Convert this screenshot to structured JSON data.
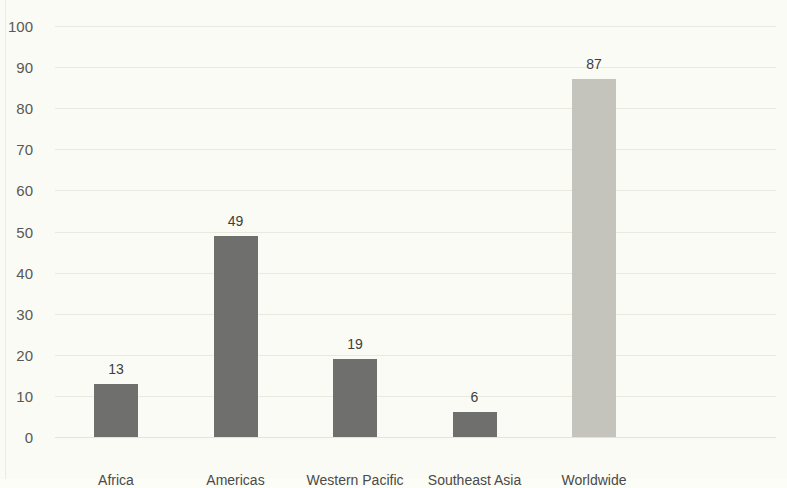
{
  "chart_data": {
    "type": "bar",
    "title": "",
    "subtitle": "",
    "xlabel": "",
    "ylabel": "",
    "categories": [
      "Africa",
      "Americas",
      "Western Pacific",
      "Southeast Asia",
      "Worldwide"
    ],
    "values": [
      13,
      49,
      19,
      6,
      87
    ],
    "value_labels": [
      "13",
      "49",
      "19",
      "6",
      "87"
    ],
    "bar_colors": [
      "#6f6f6d",
      "#6f6f6d",
      "#6f6f6d",
      "#6f6f6d",
      "#c4c4bd"
    ],
    "ylim": [
      0,
      100
    ],
    "ytick_labels": [
      "0",
      "10",
      "20",
      "30",
      "40",
      "50",
      "60",
      "70",
      "80",
      "90",
      "100"
    ],
    "ytick_values": [
      0,
      10,
      20,
      30,
      40,
      50,
      60,
      70,
      80,
      90,
      100
    ],
    "grid": true,
    "grid_axis": "y",
    "legend": false,
    "legend_position": "none",
    "background_color": "#fbfbf5",
    "gridline_color": "#e9e9df",
    "axis_text_color": "#585856",
    "data_label_color": "#3e3e3c"
  }
}
